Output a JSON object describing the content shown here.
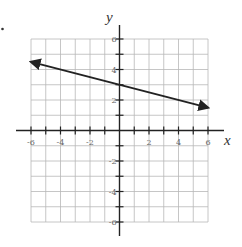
{
  "chart_data": {
    "type": "line",
    "title": "",
    "xlabel": "x",
    "ylabel": "y",
    "xlim": [
      -6,
      6
    ],
    "ylim": [
      -6,
      6
    ],
    "grid": true,
    "grid_step": 1,
    "x_ticks": [
      -6,
      -4,
      -2,
      2,
      4,
      6
    ],
    "y_ticks": [
      6,
      4,
      2,
      -2,
      -4,
      -6
    ],
    "x_tick_labels": [
      "-6",
      "-4",
      "-2",
      "2",
      "4",
      "6"
    ],
    "y_tick_labels": [
      "6",
      "4",
      "2",
      "-2",
      "-4",
      "-6"
    ],
    "series": [
      {
        "name": "line",
        "equation": "y = -x/4 + 3",
        "slope": -0.25,
        "intercept": 3,
        "x": [
          -6,
          6
        ],
        "y": [
          4.5,
          1.5
        ],
        "arrows": "both"
      }
    ]
  },
  "colors": {
    "grid": "#b8b8b8",
    "axis": "#222222",
    "line": "#222222"
  }
}
